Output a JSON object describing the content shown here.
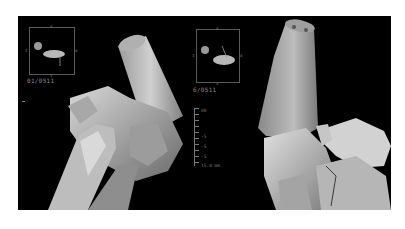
{
  "figure": {
    "background": "#ffffff",
    "panel_background": "#000000",
    "bone_color": "#c8c8c8"
  },
  "left_panel": {
    "inset_label": "01/0511",
    "inset_marks": {
      "top": "d",
      "left": "1",
      "right": "d",
      "bottom": "v"
    }
  },
  "right_panel": {
    "inset_label": "6/0511",
    "inset_marks": {
      "top": "d",
      "left": "1",
      "right": "d",
      "bottom": "v"
    },
    "scale_labels": [
      "00",
      "-5",
      "-5",
      "-5",
      "15.0 mm"
    ]
  }
}
